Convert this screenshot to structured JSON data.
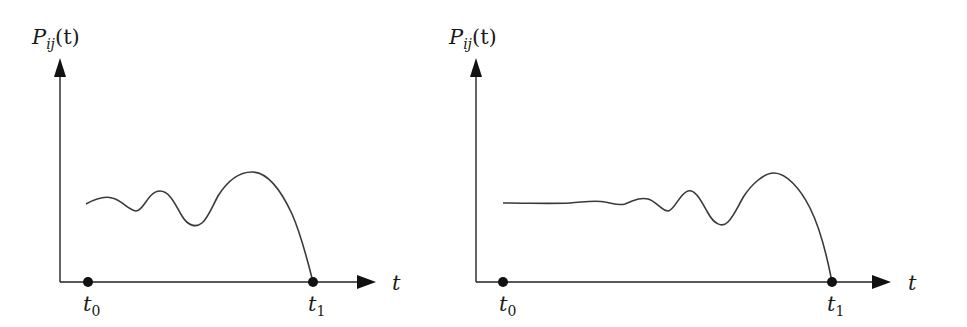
{
  "diagrams": [
    {
      "id": "left",
      "y_axis_label": {
        "main": "P",
        "sub": "ij",
        "arg": "(t)"
      },
      "x_axis_label": "t",
      "markers": [
        {
          "label": "t",
          "sub": "0"
        },
        {
          "label": "t",
          "sub": "1"
        }
      ],
      "description": "Oscillating probability curve starting at t0, wavy with growing amplitude, peaking then dropping to zero at t1"
    },
    {
      "id": "right",
      "y_axis_label": {
        "main": "P",
        "sub": "ij",
        "arg": "(t)"
      },
      "x_axis_label": "t",
      "markers": [
        {
          "label": "t",
          "sub": "0"
        },
        {
          "label": "t",
          "sub": "1"
        }
      ],
      "description": "Flat probability curve from t0 that later develops growing oscillations, peaking then dropping to zero at t1 (longer interval)"
    }
  ],
  "colors": {
    "stroke": "#1a1a1a",
    "curve": "#3a3a3a",
    "background": "#ffffff"
  }
}
